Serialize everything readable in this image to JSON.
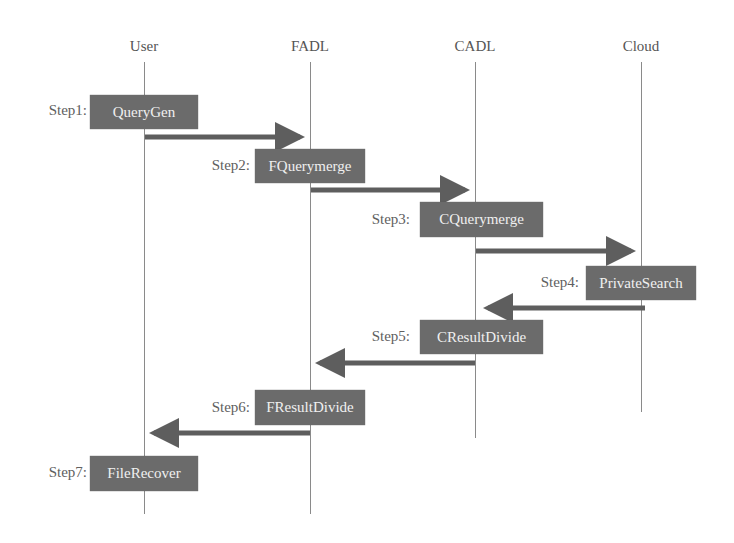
{
  "diagram": {
    "type": "sequence-diagram",
    "colors": {
      "box_fill": "#6b6b6b",
      "box_text": "#f0f0f0",
      "arrow": "#5e5e5e",
      "lifeline": "#8a8a8a",
      "label_text": "#606060"
    },
    "participants": [
      {
        "name": "User"
      },
      {
        "name": "FADL"
      },
      {
        "name": "CADL"
      },
      {
        "name": "Cloud"
      }
    ],
    "steps": [
      {
        "label": "Step1:",
        "action": "QueryGen",
        "participant": "User"
      },
      {
        "label": "Step2:",
        "action": "FQuerymerge",
        "participant": "FADL"
      },
      {
        "label": "Step3:",
        "action": "CQuerymerge",
        "participant": "CADL"
      },
      {
        "label": "Step4:",
        "action": "PrivateSearch",
        "participant": "Cloud"
      },
      {
        "label": "Step5:",
        "action": "CResultDivide",
        "participant": "CADL"
      },
      {
        "label": "Step6:",
        "action": "FResultDivide",
        "participant": "FADL"
      },
      {
        "label": "Step7:",
        "action": "FileRecover",
        "participant": "User"
      }
    ],
    "messages": [
      {
        "from": "User",
        "to": "FADL"
      },
      {
        "from": "FADL",
        "to": "CADL"
      },
      {
        "from": "CADL",
        "to": "Cloud"
      },
      {
        "from": "Cloud",
        "to": "CADL"
      },
      {
        "from": "CADL",
        "to": "FADL"
      },
      {
        "from": "FADL",
        "to": "User"
      }
    ]
  }
}
